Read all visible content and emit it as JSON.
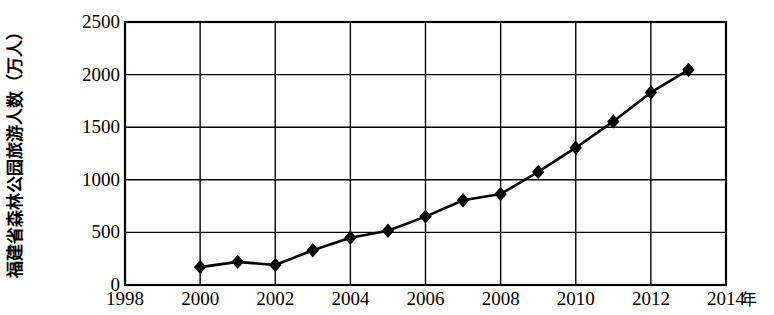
{
  "chart_data": {
    "type": "line",
    "title": "",
    "subtitle": "",
    "ylabel": "福建省森林公园旅游人数（万人）",
    "xlabel": "",
    "x_unit": "年",
    "xlim": [
      1998,
      2014
    ],
    "ylim": [
      0,
      2500
    ],
    "x_ticks": [
      "1998",
      "2000",
      "2002",
      "2004",
      "2006",
      "2008",
      "2010",
      "2012",
      "2014"
    ],
    "x_tick_values": [
      1998,
      2000,
      2002,
      2004,
      2006,
      2008,
      2010,
      2012,
      2014
    ],
    "y_ticks": [
      "0",
      "500",
      "1000",
      "1500",
      "2000",
      "2500"
    ],
    "y_tick_values": [
      0,
      500,
      1000,
      1500,
      2000,
      2500
    ],
    "grid": true,
    "legend": false,
    "marker": "diamond",
    "line_color": "#000000",
    "marker_color": "#000000",
    "grid_color": "#000000",
    "background_color": "#ffffff",
    "x": [
      2000,
      2001,
      2002,
      2003,
      2004,
      2005,
      2006,
      2007,
      2008,
      2009,
      2010,
      2011,
      2012,
      2013
    ],
    "values": [
      170,
      220,
      190,
      330,
      450,
      515,
      650,
      805,
      865,
      1075,
      1305,
      1555,
      1830,
      2045
    ],
    "series": [
      {
        "name": "福建省森林公园旅游人数",
        "values": [
          170,
          220,
          190,
          330,
          450,
          515,
          650,
          805,
          865,
          1075,
          1305,
          1555,
          1830,
          2045
        ]
      }
    ]
  }
}
